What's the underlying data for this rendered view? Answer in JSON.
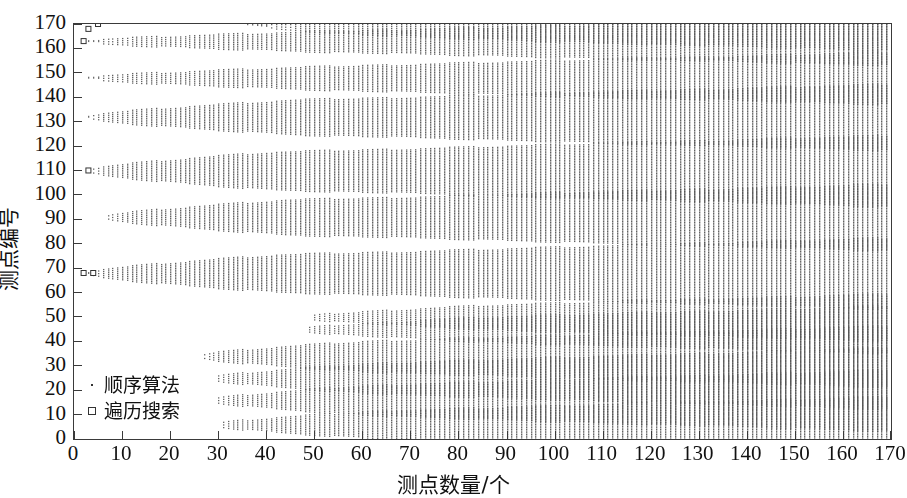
{
  "chart_data": {
    "type": "scatter",
    "title": "",
    "xlabel": "测点数量/个",
    "ylabel": "测点编号",
    "xlim": [
      0,
      170
    ],
    "ylim": [
      0,
      170
    ],
    "xticks": [
      0,
      10,
      20,
      30,
      40,
      50,
      60,
      70,
      80,
      90,
      100,
      110,
      120,
      130,
      140,
      150,
      160,
      170
    ],
    "yticks": [
      0,
      10,
      20,
      30,
      40,
      50,
      60,
      70,
      80,
      90,
      100,
      110,
      120,
      130,
      140,
      150,
      160,
      170
    ],
    "grid": false,
    "legend_position": "lower-left",
    "marker_color": "#555555",
    "frame_color": "#3a3a3a",
    "series": [
      {
        "name": "顺序算法",
        "marker": "dot",
        "description": "密集竖向点带：每个测点数量对应一段连续的测点编号覆盖范围，随测点数量增加覆盖范围逐渐变宽。",
        "bands": [
          {
            "center": 170,
            "x_start": 36,
            "x_full": 76,
            "half_at_start": 0.6,
            "half_at_end": 5.5,
            "top_clip": 171
          },
          {
            "center": 163,
            "x_start": 3,
            "x_full": 70,
            "half_at_start": 0.6,
            "half_at_end": 5.0
          },
          {
            "center": 148,
            "x_start": 3,
            "x_full": 66,
            "half_at_start": 0.6,
            "half_at_end": 5.5
          },
          {
            "center": 132,
            "x_start": 3,
            "x_full": 46,
            "half_at_start": 0.8,
            "half_at_end": 7.0
          },
          {
            "center": 110,
            "x_start": 3,
            "x_full": 40,
            "half_at_start": 0.8,
            "half_at_end": 7.5
          },
          {
            "center": 91,
            "x_start": 7,
            "x_full": 44,
            "half_at_start": 0.8,
            "half_at_end": 7.0
          },
          {
            "center": 68,
            "x_start": 3,
            "x_full": 42,
            "half_at_start": 0.8,
            "half_at_end": 7.5
          },
          {
            "center": 50,
            "x_start": 50,
            "x_full": 86,
            "half_at_start": 0.6,
            "half_at_end": 5.0
          },
          {
            "center": 45,
            "x_start": 49,
            "x_full": 84,
            "half_at_start": 0.6,
            "half_at_end": 5.0
          },
          {
            "center": 34,
            "x_start": 27,
            "x_full": 64,
            "half_at_start": 0.8,
            "half_at_end": 6.5
          },
          {
            "center": 25,
            "x_start": 30,
            "x_full": 66,
            "half_at_start": 0.8,
            "half_at_end": 6.5
          },
          {
            "center": 16,
            "x_start": 30,
            "x_full": 66,
            "half_at_start": 0.8,
            "half_at_end": 6.5
          },
          {
            "center": 6,
            "x_start": 31,
            "x_full": 68,
            "half_at_start": 0.8,
            "half_at_end": 6.0
          }
        ]
      },
      {
        "name": "遍历搜索",
        "marker": "square",
        "description": "少量离散空心方块，集中在极小的测点数量处。",
        "points": [
          {
            "x": 5,
            "y": 170
          },
          {
            "x": 3,
            "y": 168
          },
          {
            "x": 2,
            "y": 163
          },
          {
            "x": 3,
            "y": 110
          },
          {
            "x": 2,
            "y": 68
          },
          {
            "x": 4,
            "y": 68
          }
        ]
      }
    ]
  },
  "legend": {
    "items": [
      {
        "label": "顺序算法",
        "marker": "dot"
      },
      {
        "label": "遍历搜索",
        "marker": "square"
      }
    ]
  },
  "axes": {
    "x_title": "测点数量/个",
    "y_title": "测点编号"
  }
}
